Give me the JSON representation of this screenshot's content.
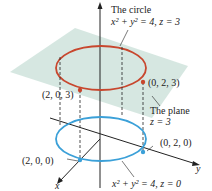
{
  "figure": {
    "title_circle_top": "The circle",
    "eq_top": "x² + y² = 4, z = 3",
    "plane_label_1": "The plane",
    "plane_label_2": "z = 3",
    "eq_bottom": "x² + y² = 4, z = 0",
    "points": {
      "p203": "(2, 0, 3)",
      "p023": "(0, 2, 3)",
      "p200": "(2, 0, 0)",
      "p020": "(0, 2, 0)"
    },
    "axes": {
      "x": "x",
      "y": "y",
      "z": "z"
    },
    "colors": {
      "top_circle": "#c8472e",
      "bottom_circle": "#3ba0d8",
      "plane": "#cfe3dc",
      "axis": "#222222"
    }
  }
}
